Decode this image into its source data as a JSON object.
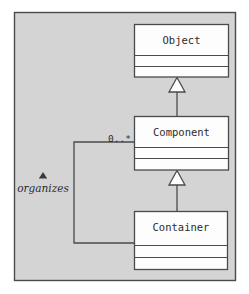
{
  "diagram": {
    "type": "uml-class-diagram",
    "background_color": "#d4d4d4",
    "frame_border_color": "#4a4a4a",
    "box_fill_color": "#fdfdfd",
    "line_color": "#4a4a4a",
    "classes": [
      {
        "id": "object",
        "name": "Object",
        "compartments": 3,
        "attributes": "",
        "operations": ""
      },
      {
        "id": "component",
        "name": "Component",
        "compartments": 3,
        "attributes": "",
        "operations": ""
      },
      {
        "id": "container",
        "name": "Container",
        "compartments": 3,
        "attributes": "",
        "operations": ""
      }
    ],
    "relationships": [
      {
        "id": "component-inherits-object",
        "kind": "generalization",
        "from": "Component",
        "to": "Object",
        "arrow": "hollow-triangle"
      },
      {
        "id": "container-inherits-component",
        "kind": "generalization",
        "from": "Container",
        "to": "Component",
        "arrow": "hollow-triangle"
      },
      {
        "id": "container-organizes-component",
        "kind": "association",
        "from": "Container",
        "to": "Component",
        "label": "organizes",
        "label_style": "italic",
        "reading_direction_marker": "solid-triangle-up",
        "multiplicity_target": "0..*"
      }
    ],
    "labels": {
      "multiplicity": "0..*",
      "association_name": "organizes"
    }
  }
}
